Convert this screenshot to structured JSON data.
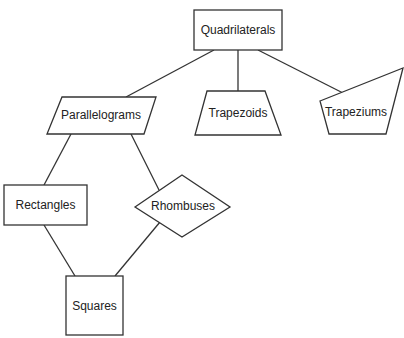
{
  "diagram": {
    "type": "hierarchy",
    "title": "",
    "nodes": [
      {
        "id": "quadrilaterals",
        "label": "Quadrilaterals",
        "shape": "rectangle"
      },
      {
        "id": "parallelograms",
        "label": "Parallelograms",
        "shape": "parallelogram"
      },
      {
        "id": "trapezoids",
        "label": "Trapezoids",
        "shape": "trapezoid"
      },
      {
        "id": "trapeziums",
        "label": "Trapeziums",
        "shape": "irregular-quadrilateral"
      },
      {
        "id": "rectangles",
        "label": "Rectangles",
        "shape": "rectangle"
      },
      {
        "id": "rhombuses",
        "label": "Rhombuses",
        "shape": "rhombus"
      },
      {
        "id": "squares",
        "label": "Squares",
        "shape": "square"
      }
    ],
    "edges": [
      {
        "from": "quadrilaterals",
        "to": "parallelograms"
      },
      {
        "from": "quadrilaterals",
        "to": "trapezoids"
      },
      {
        "from": "quadrilaterals",
        "to": "trapeziums"
      },
      {
        "from": "parallelograms",
        "to": "rectangles"
      },
      {
        "from": "parallelograms",
        "to": "rhombuses"
      },
      {
        "from": "rectangles",
        "to": "squares"
      },
      {
        "from": "rhombuses",
        "to": "squares"
      }
    ]
  },
  "labels": {
    "quadrilaterals": "Quadrilaterals",
    "parallelograms": "Parallelograms",
    "trapezoids": "Trapezoids",
    "trapeziums": "Trapeziums",
    "rectangles": "Rectangles",
    "rhombuses": "Rhombuses",
    "squares": "Squares"
  },
  "colors": {
    "stroke": "#333333",
    "fill": "#ffffff",
    "text": "#222222"
  }
}
